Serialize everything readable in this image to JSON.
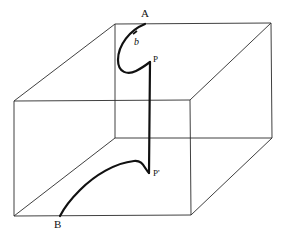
{
  "diagram": {
    "title": "",
    "type": "3D box with path curve",
    "labels": {
      "A": "A",
      "b": "b",
      "P": "P",
      "P_prime": "P'",
      "B": "B"
    },
    "colors": {
      "background": "#ffffff",
      "edges": "#2a2a2a",
      "curve": "#111111"
    },
    "box": {
      "front_face": {
        "top_left": [
          14,
          101
        ],
        "top_right": [
          190,
          100
        ],
        "bottom_right": [
          191,
          215
        ],
        "bottom_left": [
          14,
          216
        ]
      },
      "back_face": {
        "top_left": [
          115,
          24
        ],
        "top_right": [
          271,
          23
        ],
        "bottom_right": [
          272,
          138
        ],
        "bottom_left": [
          115,
          138
        ]
      }
    },
    "curve_points": {
      "A_start": [
        145,
        24
      ],
      "P_top": [
        150,
        62
      ],
      "P_prime_bottom": [
        149,
        173
      ],
      "B_end": [
        60,
        216
      ]
    }
  }
}
